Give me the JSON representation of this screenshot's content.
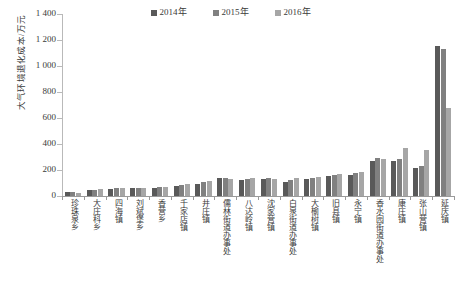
{
  "chart_data": {
    "type": "bar",
    "title": "",
    "xlabel": "",
    "ylabel": "大气环境退化成本/万元",
    "ylim": [
      0,
      1400
    ],
    "ytick_step": 200,
    "ytick_labels": [
      "0",
      "200",
      "400",
      "600",
      "800",
      "1 000",
      "1 200",
      "1 400"
    ],
    "grid": false,
    "legend_position": "top-center",
    "categories": [
      "珍珠泉乡",
      "大庄科乡",
      "四海镇",
      "刘斌堡乡",
      "香营乡",
      "千家店镇",
      "井庄镇",
      "儒林街道办事处",
      "八达岭镇",
      "沈家营镇",
      "白泉街道办事处",
      "大榆树镇",
      "旧县镇",
      "永宁镇",
      "香水园街道办事处",
      "康庄镇",
      "张山营镇",
      "延庆镇"
    ],
    "series": [
      {
        "name": "2014年",
        "color": "#595959",
        "values": [
          28,
          45,
          55,
          58,
          62,
          78,
          95,
          138,
          125,
          132,
          108,
          128,
          152,
          162,
          272,
          268,
          218,
          1152
        ]
      },
      {
        "name": "2015年",
        "color": "#808080",
        "values": [
          30,
          48,
          58,
          60,
          68,
          82,
          105,
          142,
          132,
          138,
          122,
          142,
          162,
          175,
          292,
          282,
          228,
          1130
        ]
      },
      {
        "name": "2016年",
        "color": "#a6a6a6",
        "values": [
          25,
          52,
          62,
          58,
          72,
          92,
          112,
          130,
          140,
          128,
          135,
          150,
          172,
          182,
          285,
          372,
          352,
          678
        ]
      }
    ]
  },
  "legend": {
    "entries": [
      {
        "label": "2014年",
        "color": "#595959"
      },
      {
        "label": "2015年",
        "color": "#808080"
      },
      {
        "label": "2016年",
        "color": "#a6a6a6"
      }
    ]
  }
}
